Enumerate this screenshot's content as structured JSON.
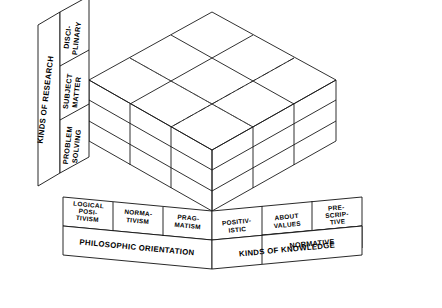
{
  "figure": {
    "type": "three-dimensional-classification-cube",
    "dimensions": 3,
    "cells_per_axis": 3
  },
  "axes": {
    "left": {
      "title": "KINDS OF RESEARCH",
      "categories": [
        "DISCI-\nPLINARY",
        "SUBJECT\nMATTER",
        "PROBLEM\nSOLVING"
      ],
      "cat_0_line_0": "DISCI-",
      "cat_0_line_1": "PLINARY",
      "cat_1_line_0": "SUBJECT",
      "cat_1_line_1": "MATTER",
      "cat_2_line_0": "PROBLEM",
      "cat_2_line_1": "SOLVING"
    },
    "bottom_left": {
      "title": "PHILOSOPHIC ORIENTATION",
      "categories": [
        "LOGICAL\nPOSI-\nTIVISM",
        "NORMA-\nTIVISM",
        "PRAG-\nMATISM"
      ],
      "cat_0_line_0": "LOGICAL",
      "cat_0_line_1": "POSI-",
      "cat_0_line_2": "TIVISM",
      "cat_1_line_0": "NORMA-",
      "cat_1_line_1": "TIVISM",
      "cat_2_line_0": "PRAG-",
      "cat_2_line_1": "MATISM"
    },
    "bottom_right": {
      "title": "KINDS OF KNOWLEDGE",
      "categories": [
        "POSITIV-\nISTIC",
        "ABOUT\nVALUES",
        "PRE-\nSCRIP-\nTIVE"
      ],
      "group_label": "NORMATIVE",
      "group_spans": [
        1,
        2
      ],
      "cat_0_line_0": "POSITIV-",
      "cat_0_line_1": "ISTIC",
      "cat_1_line_0": "ABOUT",
      "cat_1_line_1": "VALUES",
      "cat_2_line_0": "PRE-",
      "cat_2_line_1": "SCRIP-",
      "cat_2_line_2": "TIVE"
    }
  },
  "colors": {
    "stroke": "#1a1a1a",
    "hidden_stroke": "#555555",
    "background": "#ffffff",
    "text": "#000000"
  }
}
